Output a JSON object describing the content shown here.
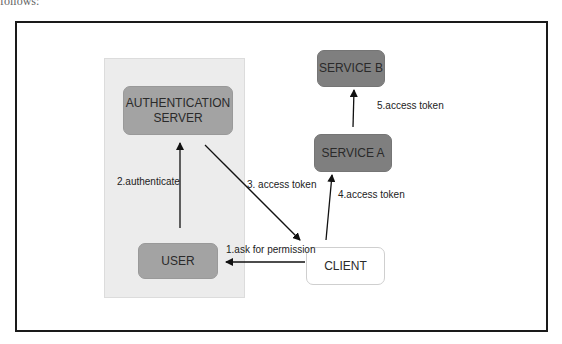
{
  "caption_fragment": "follows:",
  "diagram": {
    "title": "",
    "nodes": {
      "auth_server": {
        "label": "AUTHENTICATION SERVER",
        "line1": "AUTHENTICATION",
        "line2": "SERVER"
      },
      "user": {
        "label": "USER"
      },
      "client": {
        "label": "CLIENT"
      },
      "service_a": {
        "label": "SERVICE A"
      },
      "service_b": {
        "label": "SERVICE B"
      }
    },
    "edges": [
      {
        "from": "client",
        "to": "user",
        "label": "1.ask for permission"
      },
      {
        "from": "user",
        "to": "auth_server",
        "label": "2.authenticate"
      },
      {
        "from": "auth_server",
        "to": "client",
        "label": "3. access token"
      },
      {
        "from": "client",
        "to": "service_a",
        "label": "4.access token"
      },
      {
        "from": "service_a",
        "to": "service_b",
        "label": "5.access token"
      }
    ],
    "colors": {
      "frame": "#1a1a1a",
      "panel": "#ececec",
      "dark_node": "#7f7f7f",
      "mid_node": "#a3a3a3",
      "client_node": "#ffffff",
      "arrow": "#111111"
    }
  }
}
